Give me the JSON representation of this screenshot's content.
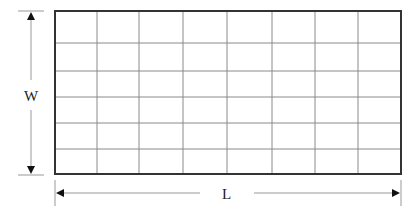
{
  "diagram": {
    "type": "grid-rectangle-dimensions",
    "labels": {
      "width": "W",
      "length": "L"
    },
    "grid": {
      "columns": 8,
      "rows": 6,
      "x_lines": [
        55,
        97,
        139,
        183,
        227,
        272,
        315,
        358,
        401
      ],
      "y_lines": [
        11,
        43,
        71,
        97,
        123,
        149,
        174
      ]
    },
    "colors": {
      "outline": "#333333",
      "grid": "#8a8a8a",
      "dimension": "#888888",
      "arrowhead": "#111111"
    }
  }
}
